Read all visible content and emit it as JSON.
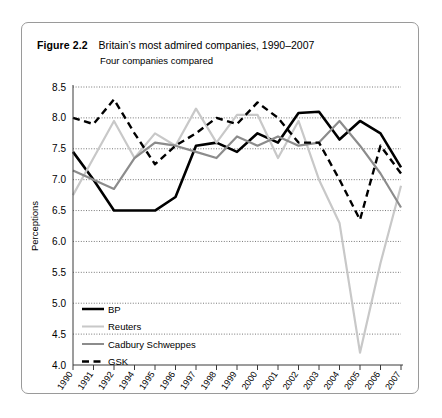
{
  "figure": {
    "label": "Figure 2.2",
    "title": "Britain’s most admired companies, 1990–2007",
    "subtitle": "Four companies compared"
  },
  "chart_data": {
    "type": "line",
    "title": "Britain’s most admired companies, 1990–2007",
    "subtitle": "Four companies compared",
    "xlabel": "",
    "ylabel": "Perceptions",
    "ylim": [
      4.0,
      8.5
    ],
    "ytick_labels": [
      "4.0",
      "4.5",
      "5.0",
      "5.5",
      "6.0",
      "6.5",
      "7.0",
      "7.5",
      "8.0",
      "8.5"
    ],
    "yticks": [
      4.0,
      4.5,
      5.0,
      5.5,
      6.0,
      6.5,
      7.0,
      7.5,
      8.0,
      8.5
    ],
    "grid": true,
    "legend_position": "lower-left-inside",
    "categories": [
      "1990",
      "1991",
      "1992",
      "1994",
      "1995",
      "1996",
      "1997",
      "1998",
      "1999",
      "2000",
      "2001",
      "2002",
      "2003",
      "2004",
      "2005",
      "2006",
      "2007"
    ],
    "series": [
      {
        "name": "BP",
        "color": "#000000",
        "style": "solid",
        "width": 2.6,
        "values": [
          7.45,
          7.0,
          6.5,
          6.5,
          6.5,
          6.72,
          7.55,
          7.6,
          7.45,
          7.75,
          7.6,
          8.08,
          8.1,
          7.65,
          7.95,
          7.75,
          7.2
        ]
      },
      {
        "name": "Reuters",
        "color": "#c8c8c8",
        "style": "solid",
        "width": 2.2,
        "values": [
          6.75,
          7.35,
          7.95,
          7.35,
          7.75,
          7.55,
          8.15,
          7.6,
          8.05,
          8.05,
          7.35,
          7.95,
          7.0,
          6.3,
          4.2,
          5.65,
          6.9
        ]
      },
      {
        "name": "Cadbury Schweppes",
        "color": "#8c8c8c",
        "style": "solid",
        "width": 2.2,
        "values": [
          7.15,
          7.0,
          6.85,
          7.35,
          7.6,
          7.55,
          7.45,
          7.35,
          7.7,
          7.55,
          7.7,
          7.55,
          7.6,
          7.95,
          7.55,
          7.1,
          6.55
        ]
      },
      {
        "name": "GSK",
        "color": "#000000",
        "style": "dashed",
        "width": 2.4,
        "values": [
          8.0,
          7.9,
          8.3,
          7.75,
          7.25,
          7.55,
          7.75,
          8.0,
          7.9,
          8.25,
          8.0,
          7.6,
          7.6,
          7.0,
          6.35,
          7.55,
          7.1
        ]
      }
    ]
  },
  "legend": {
    "items": [
      {
        "label": "BP"
      },
      {
        "label": "Reuters"
      },
      {
        "label": "Cadbury Schweppes"
      },
      {
        "label": "GSK"
      }
    ]
  }
}
